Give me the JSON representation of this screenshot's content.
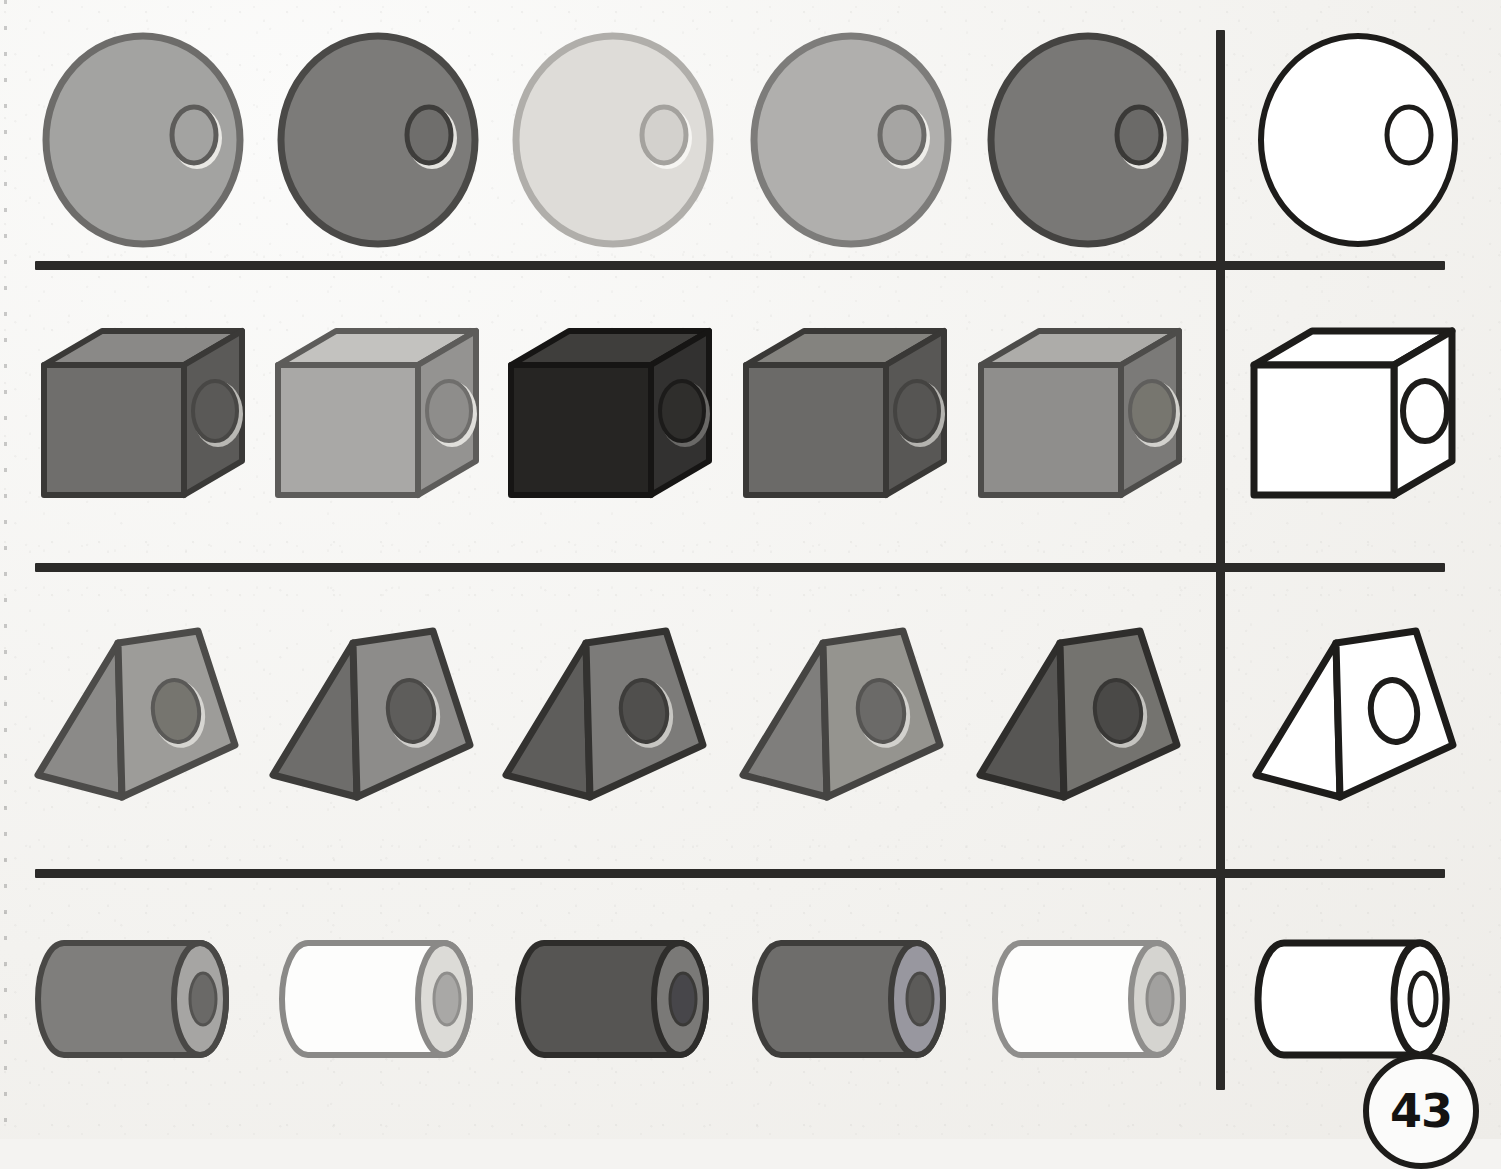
{
  "page": {
    "number": "43",
    "kind": "shape-matching-worksheet",
    "paper_color": "#f3f2ef",
    "ink_color": "#2b2a28",
    "rows": 4,
    "items_per_row": 5,
    "answer_column_items": 1
  },
  "dividers": {
    "horizontal": [
      {
        "name": "divider-row-1-2",
        "y": 261,
        "x": 35,
        "width": 1410
      },
      {
        "name": "divider-row-2-3",
        "y": 563,
        "x": 35,
        "width": 1410
      },
      {
        "name": "divider-row-3-4",
        "y": 869,
        "x": 35,
        "width": 1410
      }
    ],
    "vertical": {
      "name": "answer-column-divider",
      "x": 1216,
      "y": 30,
      "height": 1060
    }
  },
  "rows": [
    {
      "name": "row-spheres",
      "shape": "sphere",
      "shape_label": "sphere",
      "hole_label": "hole",
      "y": 30,
      "height": 225,
      "items": [
        {
          "name": "sphere-1",
          "fill": "#a3a3a1",
          "stroke": "#6d6c6a",
          "hole_fill": "#a3a3a1",
          "hole_stroke": "#5d5c5a",
          "highlight": "#e9e8e4",
          "x": 40
        },
        {
          "name": "sphere-2",
          "fill": "#7c7b79",
          "stroke": "#4a4947",
          "hole_fill": "#6f6e6c",
          "hole_stroke": "#3e3d3b",
          "highlight": "#e4e3df",
          "x": 275
        },
        {
          "name": "sphere-3",
          "fill": "#dedcd8",
          "stroke": "#b0aeaa",
          "hole_fill": "#d3d1cd",
          "hole_stroke": "#a4a29e",
          "highlight": "#f6f5f2",
          "x": 510
        },
        {
          "name": "sphere-4",
          "fill": "#b0afad",
          "stroke": "#7d7c7a",
          "hole_fill": "#a6a5a3",
          "hole_stroke": "#6b6a68",
          "highlight": "#eeede9",
          "x": 748
        },
        {
          "name": "sphere-5",
          "fill": "#797876",
          "stroke": "#444341",
          "hole_fill": "#6b6a68",
          "hole_stroke": "#3a3937",
          "highlight": "#e6e5e1",
          "x": 985
        },
        {
          "name": "sphere-outline-answer",
          "fill": "#ffffff",
          "stroke": "#1d1c1a",
          "hole_fill": "#ffffff",
          "hole_stroke": "#1d1c1a",
          "highlight": "#ffffff",
          "x": 1255,
          "outline": true
        }
      ]
    },
    {
      "name": "row-cubes",
      "shape": "cube",
      "shape_label": "cube",
      "hole_label": "hole",
      "y": 325,
      "height": 185,
      "items": [
        {
          "name": "cube-1",
          "front": "#6f6e6c",
          "top": "#8a8987",
          "side": "#5b5a58",
          "stroke": "#3a3937",
          "hole_fill": "#5a5957",
          "hole_stroke": "#484745",
          "hole_rim": "#b9b8b4",
          "x": 38
        },
        {
          "name": "cube-2",
          "front": "#a9a8a6",
          "top": "#c3c2bf",
          "side": "#949391",
          "stroke": "#5d5c5a",
          "hole_fill": "#8e8d8b",
          "hole_stroke": "#6f6e6c",
          "hole_rim": "#e0dfdb",
          "x": 272
        },
        {
          "name": "cube-3",
          "front": "#262523",
          "top": "#3f3e3c",
          "side": "#323130",
          "stroke": "#161514",
          "hole_fill": "#2f2e2c",
          "hole_stroke": "#1c1b1a",
          "hole_rim": "#6a6967",
          "x": 505
        },
        {
          "name": "cube-4",
          "front": "#6b6a68",
          "top": "#84837f",
          "side": "#585755",
          "stroke": "#393836",
          "hole_fill": "#565553",
          "hole_stroke": "#444341",
          "hole_rim": "#b4b3af",
          "x": 740
        },
        {
          "name": "cube-5",
          "front": "#8f8e8c",
          "top": "#adaca9",
          "side": "#7b7a78",
          "stroke": "#4d4c4a",
          "hole_fill": "#77766f",
          "hole_stroke": "#5f5e5c",
          "hole_rim": "#d2d1cd",
          "x": 975
        },
        {
          "name": "cube-outline-answer",
          "front": "#ffffff",
          "top": "#ffffff",
          "side": "#ffffff",
          "stroke": "#1d1c1a",
          "hole_fill": "#ffffff",
          "hole_stroke": "#1d1c1a",
          "hole_rim": "#ffffff",
          "x": 1248,
          "outline": true
        }
      ]
    },
    {
      "name": "row-prisms",
      "shape": "triangular-prism",
      "shape_label": "triangular prism",
      "hole_label": "hole",
      "y": 625,
      "height": 190,
      "items": [
        {
          "name": "prism-1",
          "left_face": "#8b8a88",
          "right_face": "#9d9c99",
          "stroke": "#4c4b49",
          "hole_fill": "#76756f",
          "hole_stroke": "#5a5957",
          "hole_rim": "#d6d5d1",
          "x": 30
        },
        {
          "name": "prism-2",
          "left_face": "#6e6d6b",
          "right_face": "#8d8c8a",
          "stroke": "#3d3c3a",
          "hole_fill": "#5e5d5b",
          "hole_stroke": "#4a4947",
          "hole_rim": "#cfcecb",
          "x": 265
        },
        {
          "name": "prism-3",
          "left_face": "#5e5d5b",
          "right_face": "#7c7b79",
          "stroke": "#333230",
          "hole_fill": "#504f4d",
          "hole_stroke": "#3d3c3a",
          "hole_rim": "#c7c6c2",
          "x": 498
        },
        {
          "name": "prism-4",
          "left_face": "#7f7e7c",
          "right_face": "#95948f",
          "stroke": "#454442",
          "hole_fill": "#6b6a68",
          "hole_stroke": "#555452",
          "hole_rim": "#d2d1cd",
          "x": 735
        },
        {
          "name": "prism-5",
          "left_face": "#575654",
          "right_face": "#74736f",
          "stroke": "#2f2e2c",
          "hole_fill": "#4a4947",
          "hole_stroke": "#383735",
          "hole_rim": "#c4c3bf",
          "x": 972
        },
        {
          "name": "prism-outline-answer",
          "left_face": "#ffffff",
          "right_face": "#ffffff",
          "stroke": "#1d1c1a",
          "hole_fill": "#ffffff",
          "hole_stroke": "#1d1c1a",
          "hole_rim": "#ffffff",
          "x": 1248,
          "outline": true
        }
      ]
    },
    {
      "name": "row-cylinders",
      "shape": "cylinder",
      "shape_label": "cylinder",
      "hole_label": "hole",
      "y": 935,
      "height": 130,
      "items": [
        {
          "name": "cylinder-1",
          "body": "#7f7e7c",
          "cap": "#a6a5a3",
          "stroke": "#494846",
          "hole_fill": "#6a6967",
          "hole_stroke": "#545351",
          "x": 28
        },
        {
          "name": "cylinder-2",
          "body": "#fdfdfc",
          "cap": "#dcdbd7",
          "stroke": "#8a8987",
          "hole_fill": "#a9a8a6",
          "hole_stroke": "#8f8e8c",
          "x": 272
        },
        {
          "name": "cylinder-3",
          "body": "#565553",
          "cap": "#7a7977",
          "stroke": "#2e2d2b",
          "hole_fill": "#47464a",
          "hole_stroke": "#3a3937",
          "x": 508
        },
        {
          "name": "cylinder-4",
          "body": "#6e6d6b",
          "cap": "#98979f",
          "stroke": "#3e3d3b",
          "hole_fill": "#5c5b59",
          "hole_stroke": "#4a4947",
          "x": 745
        },
        {
          "name": "cylinder-5",
          "body": "#fdfdfc",
          "cap": "#d5d4d0",
          "stroke": "#8f8e8c",
          "hole_fill": "#a2a19f",
          "hole_stroke": "#8a8987",
          "x": 985
        },
        {
          "name": "cylinder-outline-answer",
          "body": "#ffffff",
          "cap": "#ffffff",
          "stroke": "#1d1c1a",
          "hole_fill": "#ffffff",
          "hole_stroke": "#1d1c1a",
          "x": 1248,
          "outline": true
        }
      ]
    }
  ]
}
